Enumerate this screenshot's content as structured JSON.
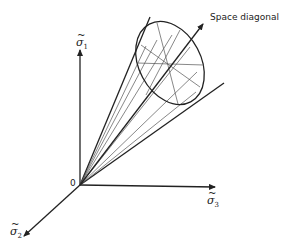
{
  "diagram": {
    "labels": {
      "space_diagonal": "Space diagonal",
      "origin": "0",
      "sigma1": "σ",
      "sigma1_sub": "1",
      "sigma2": "σ",
      "sigma2_sub": "2",
      "sigma3": "σ",
      "sigma3_sub": "3",
      "tilde": "~"
    },
    "colors": {
      "line": "#222222",
      "hatch": "#555555"
    }
  }
}
